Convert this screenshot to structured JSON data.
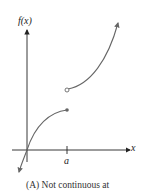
{
  "figure": {
    "y_axis_label": "f(x)",
    "x_axis_label": "x",
    "tick_label": "a",
    "caption": "(A)  Not continuous at",
    "colors": {
      "axis": "#222222",
      "curve": "#666666"
    }
  }
}
